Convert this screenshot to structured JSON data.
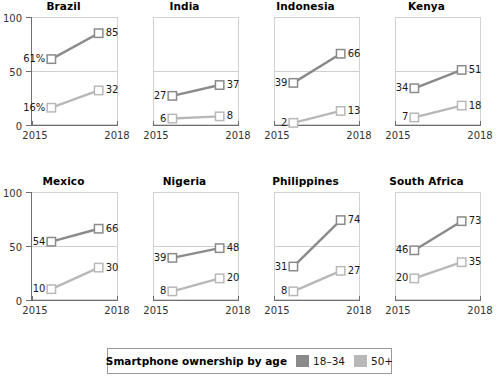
{
  "chart_data": {
    "type": "line",
    "title": "",
    "subtitle": "",
    "xlabel": "",
    "ylabel": "",
    "x": [
      "2015",
      "2018"
    ],
    "ylim": [
      0,
      100
    ],
    "yticks": [
      "0",
      "50",
      "100"
    ],
    "grid": "horizontal gridline at 50",
    "legend_position": "bottom",
    "legend_title": "Smartphone ownership by age",
    "series_names": [
      "18–34",
      "50+"
    ],
    "series_colors": [
      "#8a8a8a",
      "#b8b8b8"
    ],
    "panels": [
      {
        "name": "Brazil",
        "series": [
          {
            "name": "18–34",
            "values": [
              61,
              85
            ],
            "labels": [
              "61%",
              "85"
            ]
          },
          {
            "name": "50+",
            "values": [
              16,
              32
            ],
            "labels": [
              "16%",
              "32"
            ]
          }
        ]
      },
      {
        "name": "India",
        "series": [
          {
            "name": "18–34",
            "values": [
              27,
              37
            ],
            "labels": [
              "27",
              "37"
            ]
          },
          {
            "name": "50+",
            "values": [
              6,
              8
            ],
            "labels": [
              "6",
              "8"
            ]
          }
        ]
      },
      {
        "name": "Indonesia",
        "series": [
          {
            "name": "18–34",
            "values": [
              39,
              66
            ],
            "labels": [
              "39",
              "66"
            ]
          },
          {
            "name": "50+",
            "values": [
              2,
              13
            ],
            "labels": [
              "2",
              "13"
            ]
          }
        ]
      },
      {
        "name": "Kenya",
        "series": [
          {
            "name": "18–34",
            "values": [
              34,
              51
            ],
            "labels": [
              "34",
              "51"
            ]
          },
          {
            "name": "50+",
            "values": [
              7,
              18
            ],
            "labels": [
              "7",
              "18"
            ]
          }
        ]
      },
      {
        "name": "Mexico",
        "series": [
          {
            "name": "18–34",
            "values": [
              54,
              66
            ],
            "labels": [
              "54",
              "66"
            ]
          },
          {
            "name": "50+",
            "values": [
              10,
              30
            ],
            "labels": [
              "10",
              "30"
            ]
          }
        ]
      },
      {
        "name": "Nigeria",
        "series": [
          {
            "name": "18–34",
            "values": [
              39,
              48
            ],
            "labels": [
              "39",
              "48"
            ]
          },
          {
            "name": "50+",
            "values": [
              8,
              20
            ],
            "labels": [
              "8",
              "20"
            ]
          }
        ]
      },
      {
        "name": "Philippines",
        "series": [
          {
            "name": "18–34",
            "values": [
              31,
              74
            ],
            "labels": [
              "31",
              "74"
            ]
          },
          {
            "name": "50+",
            "values": [
              8,
              27
            ],
            "labels": [
              "8",
              "27"
            ]
          }
        ]
      },
      {
        "name": "South Africa",
        "series": [
          {
            "name": "18–34",
            "values": [
              46,
              73
            ],
            "labels": [
              "46",
              "73"
            ]
          },
          {
            "name": "50+",
            "values": [
              20,
              35
            ],
            "labels": [
              "20",
              "35"
            ]
          }
        ]
      }
    ]
  },
  "axis": {
    "x_left": "2015",
    "x_right": "2018",
    "y_0": "0",
    "y_50": "50",
    "y_100": "100"
  },
  "legend": {
    "title": "Smartphone ownership by age",
    "entries": [
      {
        "label": "18–34",
        "color": "#8a8a8a"
      },
      {
        "label": "50+",
        "color": "#b8b8b8"
      }
    ]
  }
}
